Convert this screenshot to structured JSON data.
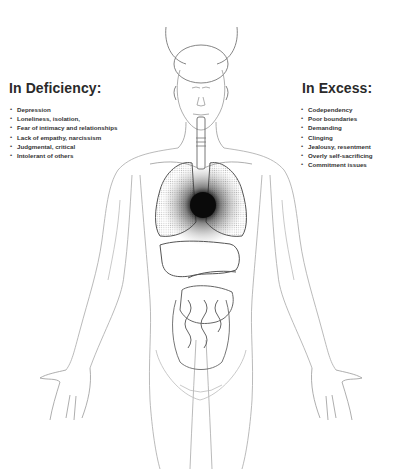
{
  "diagram": {
    "highlighted_region": "heart",
    "colors": {
      "background": "#ffffff",
      "line": "#9a9a9a",
      "dark_line": "#3a3a3a",
      "heart": "#111111",
      "text": "#2a2a2a"
    }
  },
  "deficiency": {
    "title": "In Deficiency:",
    "items": [
      "Depression",
      "Loneliness, isolation,",
      "Fear of intimacy and relationships",
      "Lack of empathy, narcissism",
      "Judgmental, critical",
      "Intolerant of others"
    ]
  },
  "excess": {
    "title": "In Excess:",
    "items": [
      "Codependency",
      "Poor boundaries",
      "Demanding",
      "Clinging",
      "Jealousy, resentment",
      "Overly self-sacrificing",
      "Commitment issues"
    ]
  }
}
